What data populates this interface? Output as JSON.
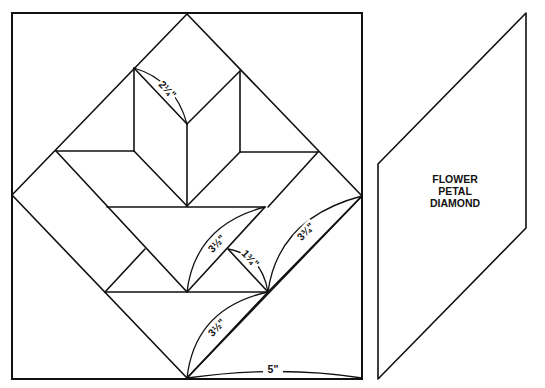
{
  "diagram": {
    "block": {
      "description": "Quilt block pattern with flower/tulip of diamonds inside square-on-point",
      "dimensions": {
        "top_petal_edge": "2¼\"",
        "leaf_edge_left": "3½\"",
        "small_leaf_edge": "1¾\"",
        "leaf_edge_right": "3¾\"",
        "stem_edge": "3½\"",
        "base_width": "5\""
      }
    },
    "template": {
      "label_lines": [
        "FLOWER",
        "PETAL",
        "DIAMOND"
      ]
    }
  }
}
